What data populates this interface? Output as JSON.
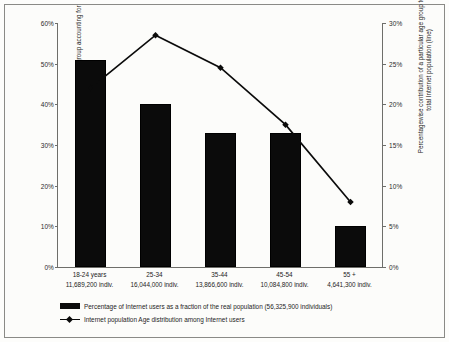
{
  "chart_data": {
    "type": "bar",
    "title": "",
    "categories": [
      "18-24 years",
      "25-34",
      "35-44",
      "45-54",
      "55 +"
    ],
    "category_counts": [
      "11,689,200 indiv.",
      "16,044,000 indiv.",
      "13,866,600 indiv.",
      "10,084,800 indiv.",
      "4,641,300 indiv."
    ],
    "series": [
      {
        "name": "Percentage  of Internet users as a fraction of  the real population (56,325,900 individuals)",
        "type": "bar",
        "axis": "left",
        "values": [
          51,
          40,
          33,
          33,
          10
        ]
      },
      {
        "name": "Internet population Age distribution among Internet users",
        "type": "line",
        "axis": "right",
        "values": [
          22,
          28.5,
          24.5,
          17.5,
          8
        ]
      }
    ],
    "xlabel": "",
    "ylabel": "Percentage of people of a particular age group accounting for internet users (bars)",
    "ylabel_right": "Percentagewise contribution of a particular age group to the total Internet population (line)",
    "ylim": [
      0,
      60
    ],
    "ylim_right": [
      0,
      30
    ],
    "yticks": [
      "0%",
      "10%",
      "20%",
      "30%",
      "40%",
      "50%",
      "60%"
    ],
    "ytick_values": [
      0,
      10,
      20,
      30,
      40,
      50,
      60
    ],
    "yticks_right": [
      "0%",
      "5%",
      "10%",
      "15%",
      "20%",
      "25%",
      "30%"
    ],
    "ytick_values_right": [
      0,
      5,
      10,
      15,
      20,
      25,
      30
    ],
    "grid": false,
    "legend_position": "bottom-left",
    "colors": {
      "bar": "#0b0b0b",
      "line": "#0b0b0b",
      "axis": "#6e6e6a",
      "text": "#1c1c1c"
    }
  }
}
